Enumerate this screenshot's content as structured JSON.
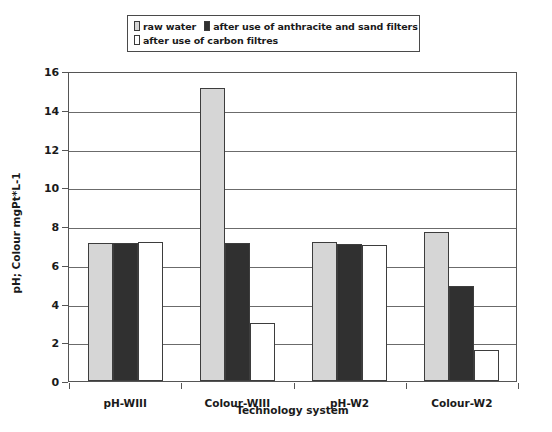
{
  "chart_data": {
    "type": "bar",
    "title": "",
    "subtitle": "",
    "xlabel": "Technology system",
    "ylabel": "pH; Colour mgPt*L-1",
    "categories": [
      "pH-WIII",
      "Colour-WIII",
      "pH-W2",
      "Colour-W2"
    ],
    "series": [
      {
        "name": "raw water",
        "color": "#d6d6d6",
        "values": [
          7.1,
          15.1,
          7.15,
          7.7
        ]
      },
      {
        "name": "after use of anthracite and sand filters",
        "color": "#303030",
        "values": [
          7.1,
          7.1,
          7.05,
          4.9
        ]
      },
      {
        "name": "after use of carbon filtres",
        "color": "#ffffff",
        "values": [
          7.2,
          3.0,
          7.0,
          1.6
        ]
      }
    ],
    "ylim": [
      0,
      16
    ],
    "ytick_values": [
      0,
      2,
      4,
      6,
      8,
      10,
      12,
      14,
      16
    ],
    "ytick_labels": [
      "0",
      "2",
      "4",
      "6",
      "8",
      "10",
      "12",
      "14",
      "16"
    ],
    "grid": "horizontal",
    "legend_position": "top"
  },
  "legend": {
    "entries": [
      {
        "label": "raw water",
        "swatch": "swatch-raw-water"
      },
      {
        "label": "after use of anthracite and sand filters",
        "swatch": "swatch-anthracite"
      },
      {
        "label": "after use of carbon filtres",
        "swatch": "swatch-carbon"
      }
    ]
  },
  "axes": {
    "y_title": "pH; Colour mgPt*L-1",
    "x_title": "Technology system",
    "y_ticks": [
      "16",
      "14",
      "12",
      "10",
      "8",
      "6",
      "4",
      "2",
      "0"
    ],
    "x_categories": [
      "pH-WIII",
      "Colour-WIII",
      "pH-W2",
      "Colour-W2"
    ]
  }
}
